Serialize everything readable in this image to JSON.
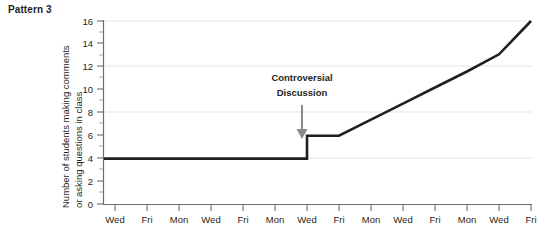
{
  "figure": {
    "title": "Pattern 3",
    "ylabel_line1": "Number of students making comments",
    "ylabel_line2": "or asking questions in class"
  },
  "annotation": {
    "line1": "Controversial",
    "line2": "Discussion",
    "arrow": "down-arrow-icon"
  },
  "axis": {
    "y_ticks": [
      "0",
      "2",
      "4",
      "6",
      "8",
      "10",
      "12",
      "14",
      "16"
    ],
    "x_ticks": [
      "Wed",
      "Fri",
      "Mon",
      "Wed",
      "Fri",
      "Mon",
      "Wed",
      "Fri",
      "Mon",
      "Wed",
      "Fri",
      "Mon",
      "Wed",
      "Fri"
    ]
  },
  "colors": {
    "line": "#231f20",
    "grid": "#e4e4e4",
    "axis": "#6d6e70",
    "arrow": "#8a8b8d"
  },
  "chart_data": {
    "type": "line",
    "title": "Pattern 3",
    "xlabel": "",
    "ylabel": "Number of students making comments or asking questions in class",
    "ylim": [
      0,
      16
    ],
    "ytick_values": [
      0,
      2,
      4,
      6,
      8,
      10,
      12,
      14,
      16
    ],
    "grid": "horizontal gridlines at 4, 8, 12, 16",
    "gridline_values": [
      4,
      8,
      12,
      16
    ],
    "legend": "none",
    "categories": [
      "Wed",
      "Fri",
      "Mon",
      "Wed",
      "Fri",
      "Mon",
      "Wed",
      "Fri",
      "Mon",
      "Wed",
      "Fri",
      "Mon",
      "Wed",
      "Fri"
    ],
    "x": [
      1,
      2,
      3,
      4,
      5,
      6,
      7,
      8,
      9,
      10,
      11,
      12,
      13,
      14
    ],
    "series": [
      {
        "name": "Number of students making comments or asking questions in class",
        "values": [
          4,
          4,
          4,
          4,
          4,
          4,
          4,
          6,
          7.4,
          8.8,
          10.2,
          11.6,
          13.1,
          16
        ]
      }
    ],
    "annotations": [
      {
        "text": "Controversial Discussion",
        "x_category": "Wed",
        "x_index": 7,
        "y": 6,
        "marker": "down arrow pointing to the step increase"
      }
    ]
  }
}
